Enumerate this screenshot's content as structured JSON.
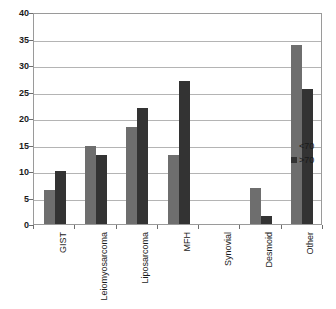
{
  "chart_data": {
    "type": "bar",
    "title": "",
    "subtitle": "",
    "xlabel": "",
    "ylabel": "",
    "ylim": [
      0,
      40
    ],
    "ytick_step": 5,
    "yticks": [
      "0",
      "5",
      "10",
      "15",
      "20",
      "25",
      "30",
      "35",
      "40"
    ],
    "grid": true,
    "legend_position": "right",
    "categories": [
      "GIST",
      "Leiomyosarcoma",
      "Liposarcoma",
      "MFH",
      "Synovial",
      "Desmoid",
      "Other"
    ],
    "series": [
      {
        "name": "<70",
        "color": "#6e6e6e",
        "values": [
          6.5,
          14.8,
          18.3,
          13.0,
          0,
          6.8,
          33.8
        ]
      },
      {
        "name": ">70",
        "color": "#333333",
        "values": [
          10.0,
          13.1,
          21.8,
          27.0,
          0,
          1.5,
          25.4
        ]
      }
    ]
  },
  "legend": {
    "items": [
      {
        "label": "<70",
        "color": "#6e6e6e"
      },
      {
        "label": ">70",
        "color": "#333333"
      }
    ]
  },
  "colors": {
    "series_under_70": "#6e6e6e",
    "series_over_70": "#333333",
    "gridline": "#b4b4b4",
    "axis": "#9a9a9a",
    "text": "#1a1a1a",
    "background": "#ffffff"
  }
}
